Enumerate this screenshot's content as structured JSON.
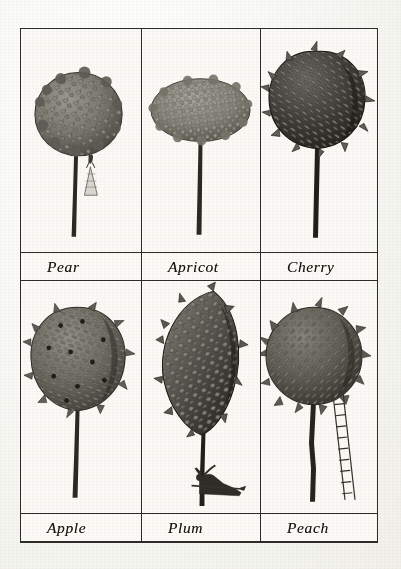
{
  "plate": {
    "title": "Fruit tree forms plate",
    "background_color": "#faf9f5",
    "ink_color": "#2e2c28",
    "rows": [
      {
        "row_index": 1,
        "cells": [
          {
            "label": "Pear",
            "tree": "pear-tree",
            "canopy_shape": "round-bushy",
            "foliage_tone": "#77756d",
            "has_figure": true,
            "figure": "standing-woman-in-long-dress",
            "has_ladder": false
          },
          {
            "label": "Apricot",
            "tree": "apricot-tree",
            "canopy_shape": "wide-flattened-oval",
            "foliage_tone": "#8a887f",
            "has_figure": false,
            "has_ladder": false
          },
          {
            "label": "Cherry",
            "tree": "cherry-tree",
            "canopy_shape": "dense-spiky-round",
            "foliage_tone": "#3c3a35",
            "has_figure": false,
            "has_ladder": false
          }
        ]
      },
      {
        "row_index": 2,
        "cells": [
          {
            "label": "Apple",
            "tree": "apple-tree",
            "canopy_shape": "round-with-fruit",
            "foliage_tone": "#6e6c63",
            "has_figure": false,
            "has_ladder": false
          },
          {
            "label": "Plum",
            "tree": "plum-tree",
            "canopy_shape": "tall-narrow-upright",
            "foliage_tone": "#4a4842",
            "has_figure": true,
            "figure": "reclining-man",
            "has_ladder": false
          },
          {
            "label": "Peach",
            "tree": "peach-tree",
            "canopy_shape": "round-spiky",
            "foliage_tone": "#5e5c54",
            "has_figure": false,
            "has_ladder": true,
            "ladder": "leaning-ladder"
          }
        ]
      }
    ]
  }
}
